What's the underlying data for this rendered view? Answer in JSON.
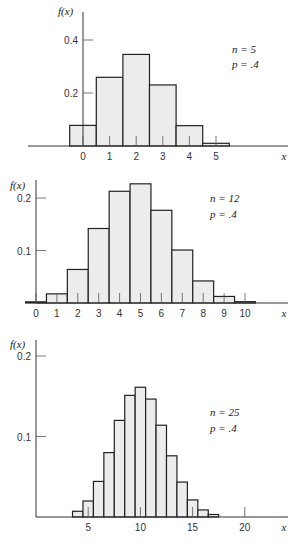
{
  "chart_data": [
    {
      "type": "bar",
      "title": "",
      "annotation": [
        "n = 5",
        "p = .4"
      ],
      "xlabel": "x",
      "ylabel": "f(x)",
      "categories": [
        0,
        1,
        2,
        3,
        4,
        5
      ],
      "values": [
        0.0778,
        0.2592,
        0.3456,
        0.2304,
        0.0768,
        0.0102
      ],
      "x_ticks": [
        "0",
        "1",
        "2",
        "3",
        "4",
        "5"
      ],
      "y_ticks": [
        "0.2",
        "0.4"
      ],
      "ylim": [
        0,
        0.45
      ]
    },
    {
      "type": "bar",
      "title": "",
      "annotation": [
        "n = 12",
        "p = .4"
      ],
      "xlabel": "x",
      "ylabel": "f(x)",
      "categories": [
        0,
        1,
        2,
        3,
        4,
        5,
        6,
        7,
        8,
        9,
        10
      ],
      "values": [
        0.0022,
        0.0174,
        0.0639,
        0.1419,
        0.2128,
        0.227,
        0.1766,
        0.1009,
        0.042,
        0.0125,
        0.0025
      ],
      "x_ticks": [
        "0",
        "1",
        "2",
        "3",
        "4",
        "5",
        "6",
        "7",
        "8",
        "9",
        "10"
      ],
      "y_ticks": [
        "0.1",
        "0.2"
      ],
      "ylim": [
        0,
        0.24
      ]
    },
    {
      "type": "bar",
      "title": "",
      "annotation": [
        "n = 25",
        "p = .4"
      ],
      "xlabel": "x",
      "ylabel": "f(x)",
      "categories": [
        4,
        5,
        6,
        7,
        8,
        9,
        10,
        11,
        12,
        13,
        14,
        15,
        16,
        17
      ],
      "values": [
        0.0071,
        0.0199,
        0.0442,
        0.08,
        0.12,
        0.1511,
        0.1612,
        0.1465,
        0.114,
        0.076,
        0.0434,
        0.0212,
        0.0088,
        0.0031
      ],
      "x_ticks": [
        "5",
        "10",
        "15",
        "20"
      ],
      "y_ticks": [
        "0.1",
        "0.2"
      ],
      "ylim": [
        0,
        0.22
      ]
    }
  ]
}
